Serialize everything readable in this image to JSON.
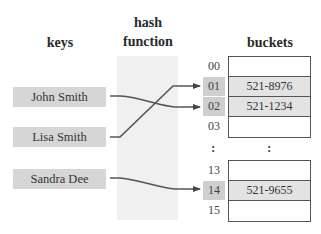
{
  "headers": {
    "keys": "keys",
    "hash_function": "hash function",
    "hash_line1": "hash",
    "hash_line2": "function",
    "buckets": "buckets"
  },
  "keys": [
    {
      "label": "John Smith",
      "maps_to": "02"
    },
    {
      "label": "Lisa Smith",
      "maps_to": "01"
    },
    {
      "label": "Sandra Dee",
      "maps_to": "14"
    }
  ],
  "buckets_top": [
    {
      "index": "00",
      "value": "",
      "highlighted": false
    },
    {
      "index": "01",
      "value": "521-8976",
      "highlighted": true
    },
    {
      "index": "02",
      "value": "521-1234",
      "highlighted": true
    },
    {
      "index": "03",
      "value": "",
      "highlighted": false
    }
  ],
  "ellipsis": {
    "index": ":",
    "value": ":"
  },
  "buckets_bottom": [
    {
      "index": "13",
      "value": "",
      "highlighted": false
    },
    {
      "index": "14",
      "value": "521-9655",
      "highlighted": true
    },
    {
      "index": "15",
      "value": "",
      "highlighted": false
    }
  ],
  "colors": {
    "key_box": "#d6d6d6",
    "hash_column": "#f0f0f0",
    "highlight_index": "#cfcfcf",
    "filled_bucket": "#e3e3e3",
    "arrow": "#444444"
  }
}
